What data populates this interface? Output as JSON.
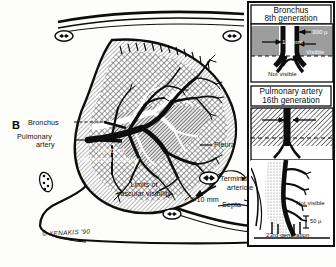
{
  "figure": {
    "panel_letter": "B",
    "signature": "© XENAKIS '90"
  },
  "main_labels": {
    "bronchus": "Bronchus",
    "pulmonary_artery_line1": "Pulmonary",
    "pulmonary_artery_line2": "artery",
    "limits_bronchial_line1": "Limits of",
    "limits_bronchial_line2": "bronchial visibility",
    "limits_vascular_line1": "Limits of",
    "limits_vascular_line2": "vascular visibility",
    "pleura": "Pleura",
    "terminal_arteriole_line1": "Terminal",
    "terminal_arteriole_line2": "arteriole",
    "septa": "Septa",
    "acinus_size": "5-10 mm"
  },
  "inset_top": {
    "title_line1": "Bronchus",
    "title_line2": "8th generation",
    "caliber_wall": "300 µ",
    "caliber_lumen": "1.5 mm",
    "visible": "Visible",
    "not_visible": "Not visible"
  },
  "inset_bottom": {
    "title_line1": "Pulmonary artery",
    "title_line2": "16th generation",
    "caliber": "300 µ",
    "visible": "Visible",
    "not_visible": "Not visible",
    "terminal_caliber": "50 µ",
    "generation": "23rd generation"
  },
  "colors": {
    "ink": "#0d0d0d",
    "paper": "#fdfdfb",
    "hatch_light": "#b9b9b9",
    "hatch_mid": "#8e8e8e",
    "hatch_dark": "#5a5a5a",
    "inset_fill": "#9a9a9a",
    "white": "#ffffff"
  }
}
